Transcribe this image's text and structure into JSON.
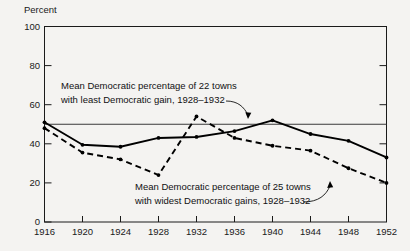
{
  "chart_data": {
    "type": "line",
    "title": "",
    "xlabel": "",
    "ylabel": "Percent",
    "x": [
      1916,
      1920,
      1924,
      1928,
      1932,
      1936,
      1940,
      1944,
      1948,
      1952
    ],
    "xtick_labels": [
      "1916",
      "1920",
      "1924",
      "1928",
      "1932",
      "1936",
      "1940",
      "1944",
      "1948",
      "1952"
    ],
    "ytick_labels": [
      "0",
      "20",
      "40",
      "60",
      "80",
      "100"
    ],
    "yticks": [
      0,
      20,
      40,
      60,
      80,
      100
    ],
    "ylim": [
      0,
      100
    ],
    "xlim": [
      1916,
      1952
    ],
    "grid": false,
    "legend_position": "none",
    "reference_line": {
      "value": 50,
      "label": "50 percent line"
    },
    "series": [
      {
        "name": "Mean Democratic percentage of 22 towns with least Democratic gain, 1928-1932",
        "style": "solid",
        "values": [
          51,
          39.5,
          38.5,
          43,
          43.5,
          46.5,
          52,
          45,
          41.5,
          33
        ]
      },
      {
        "name": "Mean Democratic percentage of 25 towns with widest Democratic gains, 1928-1932",
        "style": "dashed",
        "values": [
          48,
          35.5,
          32,
          24,
          54,
          43,
          39,
          36.5,
          27.5,
          20
        ]
      }
    ],
    "annotations": [
      {
        "id": "annotation-least-gain",
        "line1": "Mean Democratic percentage of 22 towns",
        "line2": "with least Democratic gain, 1928–1932",
        "points_to": "solid"
      },
      {
        "id": "annotation-widest-gains",
        "line1": "Mean Democratic percentage of 25 towns",
        "line2": "with widest Democratic gains, 1928–1932",
        "points_to": "dashed"
      }
    ]
  },
  "axis": {
    "y_title": "Percent"
  },
  "colors": {
    "background": "#f4f3f1",
    "ink": "#000000",
    "frame": "#1a1a1a",
    "reference": "#3a3a3a"
  }
}
